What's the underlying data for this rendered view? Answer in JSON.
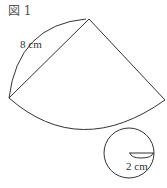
{
  "figure": {
    "title": "図 1",
    "sector_radius_label": "8 cm",
    "circle_radius_label": "2 cm"
  }
}
